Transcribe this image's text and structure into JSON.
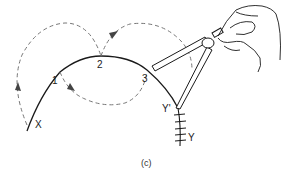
{
  "figure": {
    "caption": "(c)",
    "labels": {
      "start_point": "X",
      "step_1": "1",
      "step_2": "2",
      "step_3": "3",
      "end_point_prime": "Y'",
      "end_point": "Y"
    },
    "elements": {
      "main_curve": "solid-arc",
      "step_paths": "dashed-arcs-with-arrows",
      "instrument": "dividers-held-in-hand",
      "end_ticks": 5
    },
    "colors": {
      "stroke": "#1a1a1a",
      "dashed": "#777777",
      "background": "#ffffff"
    }
  }
}
